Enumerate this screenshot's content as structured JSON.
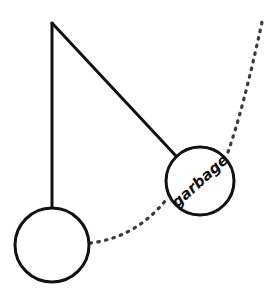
{
  "figure": {
    "title": "",
    "background_color": "#ffffff",
    "stroke_color": "#111111",
    "dot_color": "#3a3a3a",
    "width": 280,
    "height": 298
  },
  "pivot": {
    "name": "pivot-point",
    "x": 52,
    "y": 23
  },
  "rest_bob": {
    "name": "rest-position-bob",
    "label": "",
    "cx": 52,
    "cy": 245,
    "r": 37,
    "stroke_width": 3
  },
  "garbage_bob": {
    "name": "garbage-bob",
    "label": "garbage",
    "cx": 200,
    "cy": 181,
    "r": 34,
    "stroke_width": 3,
    "label_rotation_deg": -42,
    "label_font_size": 15
  },
  "rods": [
    {
      "name": "vertical-rod",
      "x1": 52,
      "y1": 23,
      "x2": 52,
      "y2": 208,
      "stroke_width": 3
    },
    {
      "name": "diagonal-rod",
      "x1": 52,
      "y1": 23,
      "x2": 176,
      "y2": 156,
      "stroke_width": 3
    }
  ],
  "dotted_paths": [
    {
      "name": "swing-arc-lower",
      "d": "M 90 243 Q 135 238 166 200",
      "dash": "1.6 6.2",
      "stroke_width": 3.2
    },
    {
      "name": "trajectory-arc-upper",
      "d": "M 228 152 Q 243 110 262 22",
      "dash": "1.6 6.2",
      "stroke_width": 3.2
    }
  ],
  "chart_data": {
    "type": "diagram",
    "nodes": [
      {
        "id": "pivot",
        "label": "",
        "x": 52,
        "y": 23,
        "shape": "point"
      },
      {
        "id": "rest_bob",
        "label": "",
        "x": 52,
        "y": 245,
        "shape": "circle",
        "r": 37
      },
      {
        "id": "garbage_bob",
        "label": "garbage",
        "x": 200,
        "y": 181,
        "shape": "circle",
        "r": 34
      }
    ],
    "edges": [
      {
        "from": "pivot",
        "to": "rest_bob",
        "style": "solid"
      },
      {
        "from": "pivot",
        "to": "garbage_bob",
        "style": "solid"
      },
      {
        "from": "rest_bob",
        "to": "garbage_bob",
        "style": "dotted"
      },
      {
        "from": "garbage_bob",
        "to": "upper_right",
        "style": "dotted"
      }
    ]
  }
}
